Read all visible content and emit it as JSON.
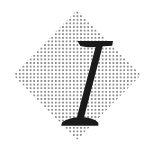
{
  "document": {
    "type": "logo-mark",
    "width": 151,
    "height": 148,
    "background_color": "#ffffff"
  },
  "logo": {
    "name": "dotted-diamond-letter-i-logo",
    "description": "A stippled dot-pattern diamond with a large italic serif letter I centered on top",
    "letter": {
      "character": "I",
      "style": "italic serif",
      "color": "#1a1a1a",
      "stem_slant_degrees": 12,
      "cap_top_y": 41,
      "cap_bottom_y": 126,
      "top_serif": {
        "x_start": 77,
        "x_end": 113,
        "y": 41,
        "thickness": 6
      },
      "bottom_serif": {
        "x_start": 61,
        "x_end": 98,
        "y": 120,
        "thickness": 6
      },
      "stem_width": 14
    },
    "diamond": {
      "shape": "rotated-square",
      "fill_pattern": "dot-grid",
      "dot_color": "#6e6e6e",
      "dot_size_px": 1.6,
      "dot_spacing_px": 3.6,
      "center_x": 77,
      "center_y": 75,
      "half_width": 64,
      "half_height": 65,
      "vertices": {
        "top": [
          77,
          10
        ],
        "right": [
          141,
          75
        ],
        "bottom": [
          77,
          140
        ],
        "left": [
          13,
          75
        ]
      }
    }
  },
  "colors": {
    "background": "#ffffff",
    "letter": "#1a1a1a",
    "dots": "#6e6e6e"
  }
}
